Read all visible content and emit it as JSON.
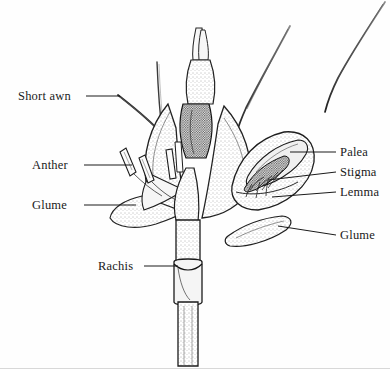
{
  "figure": {
    "style": "pen-and-ink stipple line drawing",
    "background_color": "#fefefe",
    "ink_color": "#1a1a1a",
    "border_color": "#d8d8d8"
  },
  "labels": {
    "left": [
      {
        "id": "short-awn",
        "text": "Short awn",
        "x": 18,
        "y": 90,
        "leader": {
          "x1": 86,
          "y1": 96,
          "x2": 120,
          "y2": 96
        }
      },
      {
        "id": "anther",
        "text": "Anther",
        "x": 32,
        "y": 159,
        "leader": {
          "x1": 84,
          "y1": 165,
          "x2": 132,
          "y2": 165
        }
      },
      {
        "id": "glume-left",
        "text": "Glume",
        "x": 32,
        "y": 199,
        "leader": {
          "x1": 84,
          "y1": 205,
          "x2": 136,
          "y2": 205
        }
      },
      {
        "id": "rachis",
        "text": "Rachis",
        "x": 98,
        "y": 260,
        "leader": {
          "x1": 144,
          "y1": 266,
          "x2": 178,
          "y2": 266
        }
      }
    ],
    "right": [
      {
        "id": "palea",
        "text": "Palea",
        "x": 340,
        "y": 146,
        "leader": {
          "x1": 290,
          "y1": 152,
          "x2": 336,
          "y2": 152
        }
      },
      {
        "id": "stigma",
        "text": "Stigma",
        "x": 340,
        "y": 166,
        "leader": {
          "x1": 268,
          "y1": 180,
          "x2": 336,
          "y2": 172
        }
      },
      {
        "id": "lemma",
        "text": "Lemma",
        "x": 340,
        "y": 186,
        "leader": {
          "x1": 272,
          "y1": 197,
          "x2": 336,
          "y2": 192
        }
      },
      {
        "id": "glume-right",
        "text": "Glume",
        "x": 340,
        "y": 229,
        "leader": {
          "x1": 278,
          "y1": 226,
          "x2": 336,
          "y2": 235
        }
      }
    ]
  },
  "parts": [
    "Short awn",
    "Anther",
    "Glume",
    "Rachis",
    "Palea",
    "Stigma",
    "Lemma",
    "Glume"
  ]
}
